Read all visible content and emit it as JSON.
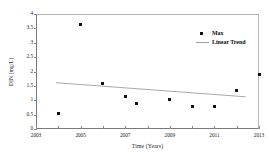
{
  "chart_data": {
    "type": "scatter",
    "title": "",
    "xlabel": "Time (Years)",
    "ylabel": "DIN (mg/L)",
    "xlim": [
      2003,
      2013
    ],
    "ylim": [
      0,
      4
    ],
    "xticks": [
      2003,
      2005,
      2007,
      2009,
      2011,
      2013
    ],
    "xtick_labels": [
      "2003",
      "2005",
      "2007",
      "2009",
      "2011",
      "2013"
    ],
    "yticks": [
      0,
      0.5,
      1,
      1.5,
      2,
      2.5,
      3,
      3.5,
      4
    ],
    "ytick_labels": [
      "0",
      "0.5",
      "1",
      "1.5",
      "2",
      "2.5",
      "3",
      "3.5",
      "4"
    ],
    "grid": false,
    "legend_position": "top-right",
    "series": [
      {
        "name": "Max",
        "type": "scatter",
        "marker": "square-dot",
        "color": "#111111",
        "x": [
          2004,
          2005,
          2006,
          2007,
          2007.5,
          2009,
          2010,
          2011,
          2012,
          2013
        ],
        "values": [
          0.55,
          3.65,
          1.57,
          1.14,
          0.87,
          1.02,
          0.8,
          0.79,
          1.33,
          1.91
        ]
      },
      {
        "name": "Linear Trend",
        "type": "line",
        "color": "#9d9d9d",
        "x": [
          2003.9,
          2012.4
        ],
        "values": [
          1.61,
          1.12
        ]
      }
    ],
    "legend": [
      {
        "label": "Max",
        "key": "marker"
      },
      {
        "label": "Linear Trend",
        "key": "line"
      }
    ],
    "colors": {
      "marker": "#111111",
      "trend_line": "#9d9d9d",
      "axis": "#7a7a7a",
      "text": "#1f1f1f",
      "background": "#ffffff"
    }
  }
}
